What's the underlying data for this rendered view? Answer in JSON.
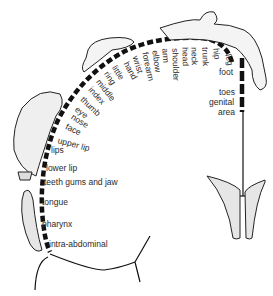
{
  "diagram": {
    "type": "motor homunculus",
    "ink_color": "#111111",
    "shade_color": "#e6e6e6",
    "labels_rotated": [
      "hand",
      "little",
      "ring",
      "middle",
      "index",
      "thumb",
      "eye",
      "nose",
      "face",
      "upper lip"
    ],
    "labels_arc_top": [
      "wrist",
      "forearm",
      "elbow",
      "arm",
      "shoulder",
      "head",
      "neck",
      "trunk",
      "hip",
      "leg"
    ],
    "labels_right": [
      "foot",
      "toes",
      "genital",
      "area"
    ],
    "labels_left_column": [
      "lips",
      "lower lip",
      "teeth gums and jaw",
      "tongue",
      "pharynx",
      "intra-abdominal"
    ]
  }
}
